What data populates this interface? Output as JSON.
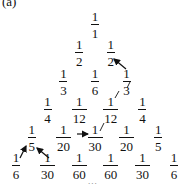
{
  "figure": {
    "label": "(a)",
    "continuation": "...",
    "rows": [
      [
        {
          "num": "1",
          "den": "1"
        }
      ],
      [
        {
          "num": "1",
          "den": "2"
        },
        {
          "num": "1",
          "den": "2"
        }
      ],
      [
        {
          "num": "1",
          "den": "3"
        },
        {
          "num": "1",
          "den": "6"
        },
        {
          "num": "1",
          "den": "3"
        }
      ],
      [
        {
          "num": "1",
          "den": "4"
        },
        {
          "num": "1",
          "den": "12"
        },
        {
          "num": "1",
          "den": "12"
        },
        {
          "num": "1",
          "den": "4"
        }
      ],
      [
        {
          "num": "1",
          "den": "5"
        },
        {
          "num": "1",
          "den": "20"
        },
        {
          "num": "1",
          "den": "30"
        },
        {
          "num": "1",
          "den": "20"
        },
        {
          "num": "1",
          "den": "5"
        }
      ],
      [
        {
          "num": "1",
          "den": "6"
        },
        {
          "num": "1",
          "den": "30"
        },
        {
          "num": "1",
          "den": "60"
        },
        {
          "num": "1",
          "den": "60"
        },
        {
          "num": "1",
          "den": "30"
        },
        {
          "num": "1",
          "den": "6"
        }
      ]
    ],
    "arrows": [
      {
        "from": "row3-col3 (1/3)",
        "to": "row2-col2 (1/2)"
      },
      {
        "from": "row5-col2 (1/20)",
        "to": "row5-col3 (1/30)"
      },
      {
        "from": "row6-col1 (1/6)",
        "to": "row5-col1 (1/5)"
      },
      {
        "from": "row6-col2 (1/30)",
        "to": "row5-col1 (1/5)"
      }
    ],
    "colors": {
      "ink": "#111111",
      "background": "#ffffff"
    }
  }
}
